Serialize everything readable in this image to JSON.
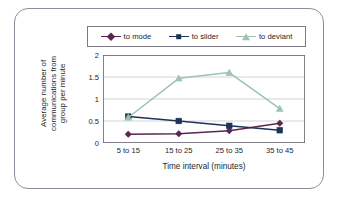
{
  "figure": {
    "border_color": "#938a9c",
    "background": "#ffffff"
  },
  "chart_data": {
    "type": "line",
    "title": "",
    "xlabel": "Time interval (minutes)",
    "ylabel": "Average number of communications from group per minute",
    "ylabel_lines": [
      "Average number of",
      "communications from",
      "group per minute"
    ],
    "categories": [
      "5 to 15",
      "15 to 25",
      "25 to 35",
      "35 to 45"
    ],
    "ylim": [
      0,
      2
    ],
    "yticks": [
      0,
      0.5,
      1,
      1.5,
      2
    ],
    "ytick_labels": [
      "0",
      "0.5",
      "1",
      "1.5",
      "2"
    ],
    "grid": "horizontal",
    "legend_position": "top",
    "series": [
      {
        "name": "to mode",
        "color": "#5c2550",
        "marker": "diamond",
        "values": [
          0.2,
          0.21,
          0.28,
          0.45
        ]
      },
      {
        "name": "to slider",
        "color": "#1d3459",
        "marker": "square",
        "values": [
          0.6,
          0.5,
          0.39,
          0.29
        ]
      },
      {
        "name": "to deviant",
        "color": "#9dc3b4",
        "marker": "triangle",
        "values": [
          0.58,
          1.47,
          1.6,
          0.78
        ]
      }
    ]
  }
}
